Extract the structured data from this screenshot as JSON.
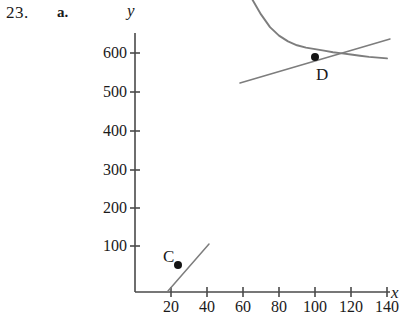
{
  "problem": {
    "number": "23.",
    "part": "a."
  },
  "axes": {
    "y_label": "y",
    "x_label": "x",
    "y_ticks": [
      {
        "value": 600,
        "label": "600",
        "py": 53
      },
      {
        "value": 500,
        "label": "500",
        "py": 92
      },
      {
        "value": 400,
        "label": "400",
        "py": 131
      },
      {
        "value": 300,
        "label": "300",
        "py": 170
      },
      {
        "value": 200,
        "label": "200",
        "py": 208
      },
      {
        "value": 100,
        "label": "100",
        "py": 246
      }
    ],
    "x_ticks": [
      {
        "value": 20,
        "label": "20",
        "px": 171
      },
      {
        "value": 40,
        "label": "40",
        "px": 207
      },
      {
        "value": 60,
        "label": "60",
        "px": 243
      },
      {
        "value": 80,
        "label": "80",
        "px": 279
      },
      {
        "value": 100,
        "label": "100",
        "px": 315
      },
      {
        "value": 120,
        "label": "120",
        "px": 351
      },
      {
        "value": 140,
        "label": "140",
        "px": 387
      }
    ],
    "origin": {
      "px": 135,
      "py": 292
    },
    "x_range": [
      0,
      148
    ],
    "y_range": [
      0,
      660
    ],
    "grid": false
  },
  "chart_data": {
    "type": "line",
    "title": "",
    "xlabel": "x",
    "ylabel": "y",
    "xlim": [
      0,
      148
    ],
    "ylim": [
      0,
      660
    ],
    "grid": false,
    "legend": null,
    "series": [
      {
        "name": "curve",
        "color": "#7d7d7d",
        "x": [
          0,
          5,
          10,
          15,
          20,
          25,
          27,
          30,
          35,
          40,
          45,
          50,
          55,
          60,
          65,
          70,
          75,
          80,
          85,
          90,
          95,
          100,
          105,
          110,
          115,
          120,
          125,
          130,
          135,
          140
        ],
        "y": [
          8,
          12,
          18,
          28,
          43,
          62,
          70,
          85,
          118,
          160,
          215,
          280,
          345,
          405,
          460,
          500,
          533,
          555,
          570,
          580,
          586,
          590,
          594,
          598,
          601,
          604,
          607,
          610,
          612,
          614
        ]
      }
    ],
    "points": [
      {
        "label": "C",
        "x": 27,
        "y": 70,
        "px": 178,
        "py": 265,
        "label_px": 163,
        "label_py": 248
      },
      {
        "label": "D",
        "x": 100,
        "y": 590,
        "px": 315,
        "py": 57,
        "label_px": 316,
        "label_py": 66
      }
    ],
    "tangent_lines": [
      {
        "at_point": "C",
        "x1": 168,
        "y1": 291,
        "x2": 209,
        "y2": 244,
        "color": "#7d7d7d"
      },
      {
        "at_point": "D",
        "x1": 240,
        "y1": 83,
        "x2": 390,
        "y2": 39,
        "color": "#7d7d7d"
      }
    ]
  },
  "colors": {
    "curve": "#7d7d7d",
    "tangent": "#7d7d7d",
    "axis": "#4a4a4a",
    "point": "#141414",
    "text": "#1a1a1a",
    "background": "#ffffff"
  }
}
